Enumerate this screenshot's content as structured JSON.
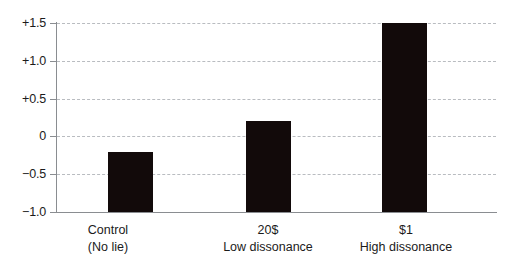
{
  "chart_data": {
    "type": "bar",
    "title": "",
    "subtitle": "",
    "xlabel": "",
    "ylabel": "",
    "categories": [
      "Control\n(No lie)",
      "20$\nLow dissonance",
      "$1\nHigh dissonance"
    ],
    "values": [
      -0.2,
      0.2,
      1.5
    ],
    "ylim": [
      -1.0,
      1.5
    ],
    "yticks": [
      1.5,
      1.0,
      0.5,
      0,
      -0.5,
      -1.0
    ],
    "ytick_labels": [
      "+1.5",
      "+1.0",
      "+0.5",
      "0",
      "−0.5",
      "−1.0"
    ],
    "grid": true,
    "grid_axis": "y",
    "grid_style": "dashed",
    "legend": false,
    "bar_color": "#120a0a",
    "grid_color": "#b9bcc0",
    "axis_color": "#8a8d91",
    "baseline_value": -1.0,
    "series": [
      {
        "name": "Enjoyment rating",
        "values": [
          -0.2,
          0.2,
          1.5
        ]
      }
    ],
    "points": [
      {
        "category": "Control",
        "sublabel": "(No lie)",
        "value": -0.2
      },
      {
        "category": "20$",
        "sublabel": "Low dissonance",
        "value": 0.2
      },
      {
        "category": "$1",
        "sublabel": "High dissonance",
        "value": 1.5
      }
    ]
  },
  "axis": {
    "y_labels": [
      {
        "text": "+1.5",
        "value": 1.5
      },
      {
        "text": "+1.0",
        "value": 1.0
      },
      {
        "text": "+0.5",
        "value": 0.5
      },
      {
        "text": "0",
        "value": 0
      },
      {
        "text": "−0.5",
        "value": -0.5
      },
      {
        "text": "−1.0",
        "value": -1.0
      }
    ]
  },
  "x_categories": [
    {
      "line1": "Control",
      "line2": "(No lie)"
    },
    {
      "line1": "20$",
      "line2": "Low dissonance"
    },
    {
      "line1": "$1",
      "line2": "High dissonance"
    }
  ]
}
